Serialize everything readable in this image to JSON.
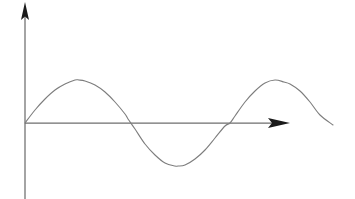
{
  "figure": {
    "title": "",
    "background_color": "#ffffff",
    "width": 355,
    "height": 199
  },
  "axes": {
    "origin": {
      "x": 25,
      "y": 123
    },
    "x_axis": {
      "name": "x-axis",
      "label": "",
      "color": "#6e6e6e",
      "start_x": 25,
      "end_x": 290,
      "y": 123,
      "arrowhead": "right",
      "arrow_tip_x": 290,
      "arrow_base_x": 268,
      "arrow_half_height": 5
    },
    "y_axis": {
      "name": "y-axis",
      "label": "",
      "color": "#6e6e6e",
      "x": 25,
      "top_y": 2,
      "bottom_y": 199,
      "arrowhead": "up",
      "arrow_tip_y": 2,
      "arrow_base_y": 20,
      "arrow_half_width": 4
    }
  },
  "chart_data": {
    "type": "line",
    "title": "",
    "xlabel": "",
    "ylabel": "",
    "grid": false,
    "legend": null,
    "curve_color": "#7d7d7d",
    "function": "y = A*sin(2*pi*x/T)",
    "amplitude_px": 43,
    "period_px": 205,
    "phase": 0,
    "x_start_px": 25,
    "x_end_px": 333,
    "baseline_y_px": 123,
    "xlim": [
      25,
      333
    ],
    "ylim": [
      80,
      166
    ],
    "key_points": [
      {
        "name": "origin-zero-crossing",
        "x": 25,
        "y": 123
      },
      {
        "name": "first-peak",
        "x": 79,
        "y": 80
      },
      {
        "name": "descending-zero-crossing",
        "x": 128,
        "y": 123
      },
      {
        "name": "trough",
        "x": 178,
        "y": 164
      },
      {
        "name": "ascending-zero-crossing",
        "x": 230,
        "y": 123
      },
      {
        "name": "second-peak",
        "x": 284,
        "y": 82
      },
      {
        "name": "curve-end",
        "x": 333,
        "y": 125
      }
    ],
    "x": [
      25,
      35,
      45,
      55,
      65,
      75,
      79,
      85,
      95,
      105,
      115,
      125,
      128,
      135,
      145,
      155,
      165,
      175,
      178,
      185,
      195,
      205,
      215,
      225,
      230,
      235,
      245,
      255,
      265,
      275,
      284,
      290,
      300,
      310,
      320,
      333
    ],
    "values": [
      0,
      13,
      24,
      33,
      39,
      43,
      43,
      42,
      38,
      31,
      21,
      9,
      4,
      -6,
      -21,
      -32,
      -40,
      -43,
      -43,
      -42,
      -36,
      -27,
      -15,
      -3,
      0,
      7,
      21,
      32,
      40,
      43,
      41,
      39,
      32,
      21,
      8,
      -2
    ]
  }
}
